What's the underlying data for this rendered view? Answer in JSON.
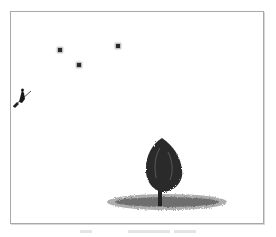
{
  "scene": {
    "type": "illustration",
    "description": "Night-sky engraving with stars, a flying figure on a broom, and a lone tree on a patch of ground",
    "stars": [
      {
        "x": 58,
        "y": 48
      },
      {
        "x": 77,
        "y": 63
      },
      {
        "x": 116,
        "y": 44
      }
    ],
    "colors": {
      "ink": "#2a2a2a",
      "frame": "#a8a8a8",
      "background": "#ffffff"
    }
  },
  "caption": {
    "text": ""
  }
}
